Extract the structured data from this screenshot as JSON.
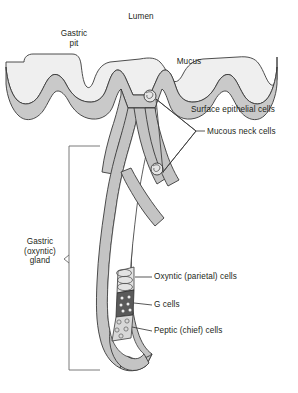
{
  "figure": {
    "type": "anatomical-cross-section"
  },
  "labels": {
    "lumen": "Lumen",
    "gastric_pit": "Gastric\npit",
    "mucus": "Mucus",
    "surface_epithelial_cells": "Surface epithelial cells",
    "mucous_neck_cells": "Mucous neck cells",
    "gastric_gland": "Gastric\n(oxyntic)\ngland",
    "oxyntic_cells": "Oxyntic (parietal) cells",
    "g_cells": "G cells",
    "peptic_cells": "Peptic (chief) cells"
  },
  "colors": {
    "background": "#ffffff",
    "mucus_layer": "#efefef",
    "epithelium_fill": "#c9c9c9",
    "gland_wall_fill": "#c4c4c4",
    "outline": "#3a3a3a",
    "text": "#231f20",
    "g_cell_fill": "#5a5a5a",
    "peptic_cell_fill": "#d8d8d8",
    "oxyntic_cell_fill": "#e3e3e3",
    "leader_line": "#3a3a3a",
    "bracket": "#6b6b6b"
  }
}
